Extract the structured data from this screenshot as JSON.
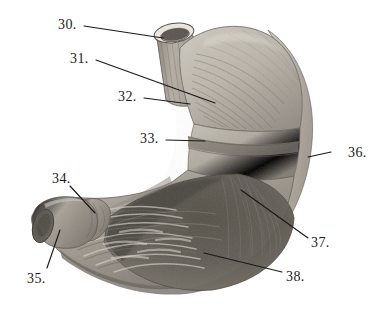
{
  "figure": {
    "style": "grayscale engraving / halftone plate",
    "background_color": "#ffffff",
    "ink_color": "#1a1a1a",
    "width": 379,
    "height": 322
  },
  "palette": {
    "background": "#ffffff",
    "line": "#1a1a1a",
    "serosa_highlight": "#e2ded5",
    "serosa_mid": "#c9c4b9",
    "muscle_light": "#b9b4aa",
    "muscle_mid": "#a39d93",
    "muscle_dark": "#7d776e",
    "cavity_dark": "#5d5952",
    "cavity_deep": "#4a4741",
    "rugae_light": "#cfcabf",
    "esophagus_rim": "#ded9cf"
  },
  "labels": [
    {
      "id": "30",
      "text": "30.",
      "text_x": 58,
      "text_y": 18,
      "leader": [
        [
          84,
          26
        ],
        [
          163,
          38
        ]
      ],
      "target": "esophagus-cut-end"
    },
    {
      "id": "31",
      "text": "31.",
      "text_x": 70,
      "text_y": 52,
      "leader": [
        [
          96,
          60
        ],
        [
          215,
          103
        ]
      ],
      "target": "fundus-oblique-fibers"
    },
    {
      "id": "32",
      "text": "32.",
      "text_x": 118,
      "text_y": 90,
      "leader": [
        [
          144,
          98
        ],
        [
          190,
          104
        ]
      ],
      "target": "stomach-body-longitudinal-muscle"
    },
    {
      "id": "33",
      "text": "33.",
      "text_x": 140,
      "text_y": 132,
      "leader": [
        [
          166,
          140
        ],
        [
          205,
          141
        ]
      ],
      "target": "circular-muscle-band"
    },
    {
      "id": "34",
      "text": "34.",
      "text_x": 52,
      "text_y": 172,
      "leader": [
        [
          70,
          186
        ],
        [
          95,
          213
        ]
      ],
      "target": "pyloric-sphincter"
    },
    {
      "id": "35",
      "text": "35.",
      "text_x": 27,
      "text_y": 272,
      "leader": [
        [
          47,
          268
        ],
        [
          60,
          230
        ]
      ],
      "target": "duodenum-cut-end"
    },
    {
      "id": "36",
      "text": "36.",
      "text_x": 348,
      "text_y": 146,
      "leader": [
        [
          331,
          152
        ],
        [
          308,
          157
        ]
      ],
      "target": "serosa-greater-curvature"
    },
    {
      "id": "37",
      "text": "37.",
      "text_x": 311,
      "text_y": 236,
      "leader": [
        [
          308,
          238
        ],
        [
          241,
          190
        ]
      ],
      "target": "submucosa-interior-wall"
    },
    {
      "id": "38",
      "text": "38.",
      "text_x": 286,
      "text_y": 270,
      "leader": [
        [
          282,
          272
        ],
        [
          204,
          253
        ]
      ],
      "target": "gastric-rugae-mucosa"
    }
  ]
}
